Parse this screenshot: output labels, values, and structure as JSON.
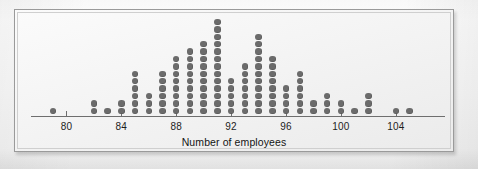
{
  "figure": {
    "caption_title": "Number of employees",
    "frame_border_color": "#9a9a9a",
    "dot_color": "#6b6b6b",
    "axis_color": "#6e6e6e",
    "background_color": "#f4f4f4"
  },
  "chart_data": {
    "type": "dotplot",
    "title": "",
    "xlabel": "Number of employees",
    "ylabel": "",
    "grid": false,
    "legend": "none",
    "xlim": [
      78,
      107
    ],
    "xticks": [
      80,
      84,
      88,
      92,
      96,
      100,
      104
    ],
    "xtick_labels": [
      "80",
      "84",
      "88",
      "92",
      "96",
      "100",
      "104"
    ],
    "dot_unit": 1,
    "x": [
      79,
      82,
      83,
      84,
      85,
      86,
      87,
      88,
      89,
      90,
      91,
      92,
      93,
      94,
      95,
      96,
      97,
      98,
      99,
      100,
      101,
      102,
      104,
      105
    ],
    "counts": [
      1,
      2,
      1,
      2,
      6,
      3,
      6,
      8,
      9,
      10,
      13,
      5,
      7,
      11,
      8,
      4,
      6,
      2,
      3,
      2,
      1,
      3,
      1,
      1
    ],
    "values": [
      1,
      2,
      1,
      2,
      6,
      3,
      6,
      8,
      9,
      10,
      13,
      5,
      7,
      11,
      8,
      4,
      6,
      2,
      3,
      2,
      1,
      3,
      1,
      1
    ],
    "categories": [
      "79",
      "82",
      "83",
      "84",
      "85",
      "86",
      "87",
      "88",
      "89",
      "90",
      "91",
      "92",
      "93",
      "94",
      "95",
      "96",
      "97",
      "98",
      "99",
      "100",
      "101",
      "102",
      "104",
      "105"
    ],
    "total_observations": 115,
    "mode": 91,
    "min": 79,
    "max": 105
  },
  "ghost": {
    "bleed_text": ""
  }
}
